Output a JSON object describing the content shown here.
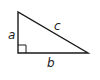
{
  "diagram": {
    "type": "right-triangle",
    "labels": {
      "vertical_leg": "a",
      "horizontal_leg": "b",
      "hypotenuse": "c"
    },
    "right_angle_marker": true,
    "colors": {
      "stroke": "#1a1a1a",
      "background": "#ffffff"
    }
  }
}
